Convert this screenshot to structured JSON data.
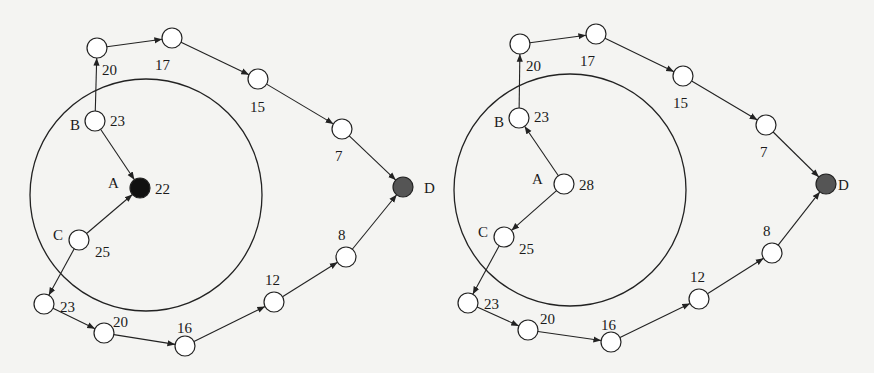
{
  "diagrams": [
    {
      "id": "left",
      "ring": {
        "cx": 146,
        "cy": 195,
        "r": 116
      },
      "nodes": [
        {
          "id": "n1",
          "x": 97,
          "y": 48,
          "value": "20",
          "vx": 102,
          "vy": 75,
          "fill": "#ffffff"
        },
        {
          "id": "n2",
          "x": 172,
          "y": 38,
          "value": "17",
          "vx": 155,
          "vy": 70,
          "fill": "#ffffff"
        },
        {
          "id": "n3",
          "x": 258,
          "y": 79,
          "value": "15",
          "vx": 250,
          "vy": 112,
          "fill": "#ffffff"
        },
        {
          "id": "n4",
          "x": 342,
          "y": 129,
          "value": "7",
          "vx": 335,
          "vy": 161,
          "fill": "#ffffff"
        },
        {
          "id": "D",
          "x": 403,
          "y": 187,
          "name": "D",
          "nx": 424,
          "ny": 193,
          "fill": "#555555"
        },
        {
          "id": "B",
          "x": 95,
          "y": 121,
          "name": "B",
          "nx": 70,
          "ny": 130,
          "value": "23",
          "vx": 110,
          "vy": 126,
          "fill": "#ffffff"
        },
        {
          "id": "A",
          "x": 140,
          "y": 188,
          "name": "A",
          "nx": 108,
          "ny": 188,
          "value": "22",
          "vx": 155,
          "vy": 194,
          "fill": "#111111"
        },
        {
          "id": "C",
          "x": 79,
          "y": 240,
          "name": "C",
          "nx": 53,
          "ny": 240,
          "value": "25",
          "vx": 95,
          "vy": 257,
          "fill": "#ffffff"
        },
        {
          "id": "n5",
          "x": 44,
          "y": 304,
          "value": "23",
          "vx": 60,
          "vy": 312,
          "fill": "#ffffff"
        },
        {
          "id": "n6",
          "x": 104,
          "y": 333,
          "value": "20",
          "vx": 113,
          "vy": 327,
          "fill": "#ffffff"
        },
        {
          "id": "n7",
          "x": 185,
          "y": 346,
          "value": "16",
          "vx": 177,
          "vy": 333,
          "fill": "#ffffff"
        },
        {
          "id": "n8",
          "x": 274,
          "y": 302,
          "value": "12",
          "vx": 265,
          "vy": 285,
          "fill": "#ffffff"
        },
        {
          "id": "n9",
          "x": 346,
          "y": 257,
          "value": "8",
          "vx": 338,
          "vy": 240,
          "fill": "#ffffff"
        }
      ],
      "edges": [
        [
          "B",
          "n1"
        ],
        [
          "n1",
          "n2"
        ],
        [
          "n2",
          "n3"
        ],
        [
          "n3",
          "n4"
        ],
        [
          "n4",
          "D"
        ],
        [
          "B",
          "A"
        ],
        [
          "C",
          "A"
        ],
        [
          "C",
          "n5"
        ],
        [
          "n5",
          "n6"
        ],
        [
          "n6",
          "n7"
        ],
        [
          "n7",
          "n8"
        ],
        [
          "n8",
          "n9"
        ],
        [
          "n9",
          "D"
        ]
      ]
    },
    {
      "id": "right",
      "ring": {
        "cx": 570,
        "cy": 190,
        "r": 116
      },
      "nodes": [
        {
          "id": "n1",
          "x": 520,
          "y": 44,
          "value": "20",
          "vx": 526,
          "vy": 71,
          "fill": "#ffffff"
        },
        {
          "id": "n2",
          "x": 596,
          "y": 34,
          "value": "17",
          "vx": 580,
          "vy": 66,
          "fill": "#ffffff"
        },
        {
          "id": "n3",
          "x": 683,
          "y": 76,
          "value": "15",
          "vx": 673,
          "vy": 108,
          "fill": "#ffffff"
        },
        {
          "id": "n4",
          "x": 766,
          "y": 125,
          "value": "7",
          "vx": 760,
          "vy": 157,
          "fill": "#ffffff"
        },
        {
          "id": "D",
          "x": 826,
          "y": 184,
          "name": "D",
          "nx": 838,
          "ny": 190,
          "fill": "#555555"
        },
        {
          "id": "B",
          "x": 519,
          "y": 118,
          "name": "B",
          "nx": 494,
          "ny": 127,
          "value": "23",
          "vx": 534,
          "vy": 122,
          "fill": "#ffffff"
        },
        {
          "id": "A",
          "x": 564,
          "y": 184,
          "name": "A",
          "nx": 532,
          "ny": 184,
          "value": "28",
          "vx": 579,
          "vy": 190,
          "fill": "#ffffff"
        },
        {
          "id": "C",
          "x": 504,
          "y": 237,
          "name": "C",
          "nx": 478,
          "ny": 237,
          "value": "25",
          "vx": 519,
          "vy": 254,
          "fill": "#ffffff"
        },
        {
          "id": "n5",
          "x": 468,
          "y": 303,
          "value": "23",
          "vx": 484,
          "vy": 309,
          "fill": "#ffffff"
        },
        {
          "id": "n6",
          "x": 528,
          "y": 330,
          "value": "20",
          "vx": 540,
          "vy": 324,
          "fill": "#ffffff"
        },
        {
          "id": "n7",
          "x": 611,
          "y": 342,
          "value": "16",
          "vx": 601,
          "vy": 330,
          "fill": "#ffffff"
        },
        {
          "id": "n8",
          "x": 699,
          "y": 299,
          "value": "12",
          "vx": 690,
          "vy": 282,
          "fill": "#ffffff"
        },
        {
          "id": "n9",
          "x": 772,
          "y": 253,
          "value": "8",
          "vx": 763,
          "vy": 236,
          "fill": "#ffffff"
        }
      ],
      "edges": [
        [
          "B",
          "n1"
        ],
        [
          "n1",
          "n2"
        ],
        [
          "n2",
          "n3"
        ],
        [
          "n3",
          "n4"
        ],
        [
          "n4",
          "D"
        ],
        [
          "A",
          "B"
        ],
        [
          "A",
          "C"
        ],
        [
          "C",
          "n5"
        ],
        [
          "n5",
          "n6"
        ],
        [
          "n6",
          "n7"
        ],
        [
          "n7",
          "n8"
        ],
        [
          "n8",
          "n9"
        ],
        [
          "n9",
          "D"
        ]
      ]
    }
  ]
}
